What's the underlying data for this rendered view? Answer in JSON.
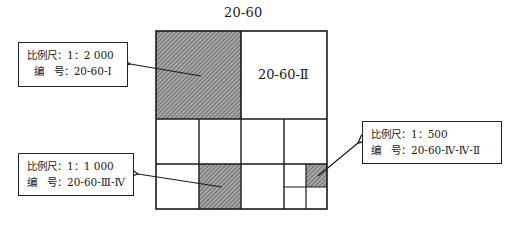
{
  "title": "20-60",
  "sheets": {
    "top_right_label": "20-60-Ⅱ"
  },
  "callouts": [
    {
      "scale_label": "比例尺：1：2 000",
      "number_label": "  编   号：20-60-Ⅰ"
    },
    {
      "scale_label": "比例尺：1：1 000",
      "number_label": "编   号：20-60-Ⅲ-Ⅳ"
    },
    {
      "scale_label": "比例尺：1：500",
      "number_label": "编   号：20-60-Ⅳ-Ⅳ-Ⅱ"
    }
  ],
  "colors": {
    "line": "#1a1a1a",
    "hatch_bg": "#9a9a9a",
    "hatch_line": "#5a5a5a"
  }
}
